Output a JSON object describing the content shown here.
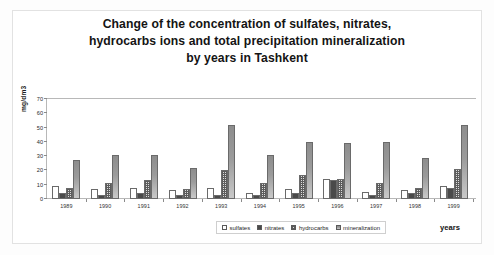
{
  "chart_data": {
    "type": "bar",
    "title": "Change of the concentration of sulfates, nitrates, hydrocarbs ions and total precipitation mineralization by years in  Tashkent",
    "title_lines": [
      "Change of the concentration of sulfates, nitrates,",
      "hydrocarbs ions and total precipitation mineralization",
      "by years in  Tashkent"
    ],
    "xlabel": "years",
    "ylabel": "mg/dm3",
    "ylim": [
      0,
      70
    ],
    "yticks": [
      0,
      10,
      20,
      30,
      40,
      50,
      60,
      70
    ],
    "ytick_labels": [
      "0",
      "10",
      "20",
      "30",
      "40",
      "50",
      "60",
      "70"
    ],
    "grid": false,
    "legend_position": "bottom",
    "categories": [
      "1989",
      "1990",
      "1991",
      "1992",
      "1993",
      "1994",
      "1995",
      "1996",
      "1997",
      "1998",
      "1999"
    ],
    "series": [
      {
        "name": "sulfates",
        "color": "#ffffff",
        "values": [
          9,
          7,
          8,
          6,
          8,
          4,
          7,
          14,
          5,
          6,
          9
        ]
      },
      {
        "name": "nitrates",
        "color": "#4a4a4a",
        "values": [
          4,
          3,
          4,
          3,
          3,
          3,
          4,
          13,
          3,
          4,
          8
        ]
      },
      {
        "name": "hydrocarbs",
        "color": "#5c5c5c",
        "values": [
          8,
          11,
          13,
          7,
          20,
          11,
          17,
          14,
          11,
          8,
          21
        ]
      },
      {
        "name": "mineralization",
        "color": "#9b9b9b",
        "values": [
          27,
          31,
          31,
          22,
          52,
          31,
          40,
          39,
          40,
          29,
          52
        ]
      }
    ]
  },
  "legend": {
    "items": [
      {
        "label": "sulfates"
      },
      {
        "label": "nitrates"
      },
      {
        "label": "hydrocarbs"
      },
      {
        "label": "mineralization"
      }
    ]
  }
}
